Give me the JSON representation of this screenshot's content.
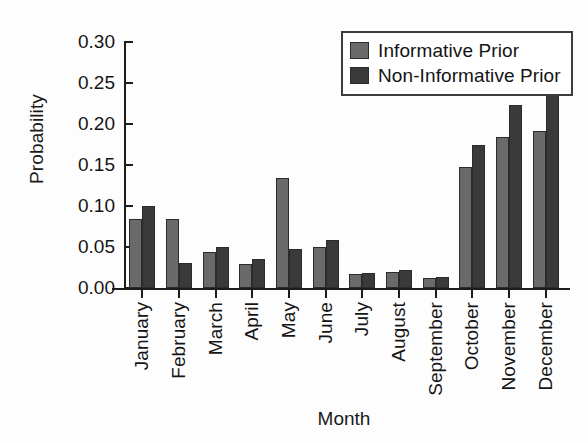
{
  "chart_data": {
    "type": "bar",
    "title": "",
    "xlabel": "Month",
    "ylabel": "Probability",
    "ylim": [
      0.0,
      0.3
    ],
    "yticks": [
      0.3,
      0.25,
      0.2,
      0.15,
      0.1,
      0.05,
      0.0
    ],
    "ytick_labels": [
      "0.30",
      "0.25",
      "0.20",
      "0.15",
      "0.10",
      "0.05",
      "0.00"
    ],
    "grid": false,
    "legend_position": "top-right",
    "categories": [
      "January",
      "February",
      "March",
      "April",
      "May",
      "June",
      "July",
      "August",
      "September",
      "October",
      "November",
      "December"
    ],
    "series": [
      {
        "name": "Informative Prior",
        "color": "#6a6a6a",
        "values": [
          0.084,
          0.084,
          0.044,
          0.029,
          0.134,
          0.05,
          0.017,
          0.02,
          0.012,
          0.148,
          0.184,
          0.191
        ]
      },
      {
        "name": "Non-Informative Prior",
        "color": "#3a3a3a",
        "values": [
          0.1,
          0.03,
          0.05,
          0.035,
          0.048,
          0.059,
          0.018,
          0.022,
          0.014,
          0.175,
          0.223,
          0.235
        ]
      }
    ]
  },
  "legend": {
    "entries": [
      {
        "label": "Informative Prior",
        "swatch": "#6a6a6a"
      },
      {
        "label": "Non-Informative Prior",
        "swatch": "#3a3a3a"
      }
    ]
  }
}
